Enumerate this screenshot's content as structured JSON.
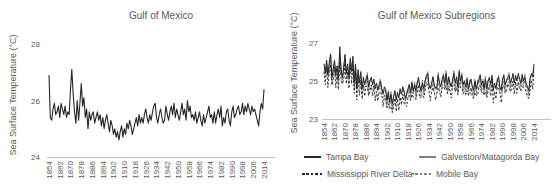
{
  "colors": {
    "line_black": "#262626",
    "line_gray": "#808080",
    "axis_line": "#bfbfbf",
    "text": "#595959"
  },
  "chart_data": [
    {
      "id": "gulf",
      "type": "line",
      "title": "Gulf of Mexico",
      "ylabel": "Sea Surface Temperature (°C)",
      "x_start": 1854,
      "x_end": 2014,
      "x_step": 1,
      "x_ticks": [
        1854,
        1862,
        1870,
        1878,
        1886,
        1894,
        1902,
        1910,
        1918,
        1926,
        1934,
        1942,
        1950,
        1958,
        1966,
        1974,
        1982,
        1990,
        1998,
        2006,
        2014
      ],
      "y_ticks": [
        24,
        26,
        28
      ],
      "ylim": [
        24,
        28.3
      ],
      "grid": false,
      "legend_position": "none",
      "series": [
        {
          "name": "Gulf of Mexico",
          "color": "#262626",
          "dash": null,
          "width": 1.1,
          "values": [
            26.9,
            25.4,
            25.3,
            25.7,
            25.9,
            25.5,
            25.6,
            25.8,
            25.4,
            25.9,
            25.7,
            25.5,
            25.8,
            25.4,
            25.6,
            25.5,
            26.4,
            27.1,
            26.2,
            25.6,
            25.2,
            26.0,
            25.3,
            25.9,
            26.6,
            25.8,
            26.1,
            25.4,
            25.7,
            25.0,
            25.6,
            25.3,
            25.5,
            25.6,
            25.2,
            25.4,
            25.6,
            25.3,
            25.5,
            25.1,
            25.4,
            25.0,
            25.3,
            25.5,
            25.2,
            24.9,
            25.3,
            25.1,
            24.8,
            25.0,
            24.7,
            24.9,
            24.6,
            24.9,
            25.1,
            24.7,
            25.0,
            24.8,
            25.2,
            25.0,
            25.3,
            25.1,
            24.8,
            25.0,
            25.2,
            25.4,
            25.1,
            25.5,
            25.2,
            25.4,
            25.2,
            25.5,
            25.7,
            25.4,
            25.2,
            25.5,
            25.3,
            25.6,
            25.8,
            25.9,
            25.4,
            25.2,
            25.5,
            25.7,
            25.4,
            25.2,
            25.3,
            25.8,
            25.5,
            25.3,
            25.6,
            25.8,
            25.5,
            25.9,
            25.4,
            25.7,
            25.5,
            25.3,
            25.6,
            25.9,
            25.5,
            25.7,
            25.3,
            26.0,
            25.6,
            25.8,
            25.4,
            25.5,
            25.3,
            25.6,
            25.2,
            25.4,
            25.6,
            25.3,
            25.1,
            25.5,
            25.2,
            25.4,
            25.6,
            25.8,
            25.4,
            25.5,
            25.2,
            25.6,
            25.2,
            25.5,
            25.7,
            25.4,
            25.8,
            25.1,
            25.4,
            25.2,
            25.6,
            25.7,
            25.3,
            25.1,
            25.6,
            25.8,
            25.4,
            25.5,
            25.7,
            25.8,
            25.5,
            25.6,
            25.9,
            25.5,
            25.8,
            25.6,
            25.9,
            25.7,
            25.5,
            25.8,
            25.6,
            25.7,
            25.5,
            25.3,
            25.1,
            25.6,
            25.9,
            25.7,
            26.4
          ]
        }
      ]
    },
    {
      "id": "subregions",
      "type": "line",
      "title": "Gulf of Mexico Subregions",
      "ylabel": "Sea Surface Temperature (°C)",
      "x_start": 1854,
      "x_end": 2014,
      "x_step": 1,
      "x_ticks": [
        1854,
        1862,
        1870,
        1878,
        1886,
        1894,
        1902,
        1910,
        1918,
        1926,
        1934,
        1942,
        1950,
        1958,
        1966,
        1974,
        1982,
        1990,
        1998,
        2006,
        2014
      ],
      "y_ticks": [
        23,
        25,
        27
      ],
      "ylim": [
        23,
        27.2
      ],
      "grid": false,
      "legend_position": "bottom",
      "series": [
        {
          "name": "Galveston/Matagorda Bay",
          "color": "#808080",
          "dash": null,
          "width": 0.9,
          "values": [
            25.7,
            25.5,
            25.95,
            25.45,
            25.75,
            26.45,
            25.0,
            25.7,
            25.95,
            25.45,
            25.55,
            25.15,
            26.3,
            25.7,
            25.05,
            25.85,
            26.15,
            25.45,
            25.7,
            25.3,
            26.05,
            25.65,
            26.05,
            24.95,
            25.7,
            24.7,
            25.45,
            25.05,
            25.25,
            24.65,
            25.0,
            24.9,
            24.95,
            25.45,
            24.45,
            25.05,
            25.0,
            24.9,
            24.95,
            24.75,
            24.65,
            24.55,
            24.6,
            25.1,
            24.45,
            24.45,
            24.45,
            24.55,
            23.8,
            24.5,
            23.75,
            24.45,
            23.55,
            24.25,
            24.3,
            24.1,
            24.25,
            24.25,
            24.35,
            24.35,
            24.5,
            24.5,
            23.95,
            24.45,
            24.35,
            24.85,
            24.2,
            25.0,
            24.35,
            24.95,
            24.25,
            24.95,
            25.0,
            24.8,
            24.35,
            25.05,
            24.35,
            25.05,
            25.1,
            25.5,
            24.65,
            24.75,
            24.65,
            25.25,
            24.6,
            24.7,
            24.55,
            25.45,
            24.65,
            24.75,
            24.9,
            25.4,
            24.75,
            25.55,
            24.55,
            25.25,
            24.7,
            24.8,
            24.95,
            25.55,
            24.65,
            25.25,
            24.5,
            25.6,
            24.85,
            25.45,
            24.55,
            25.05,
            24.5,
            25.2,
            24.45,
            25.05,
            24.85,
            24.75,
            24.3,
            25.1,
            24.45,
            25.05,
            24.85,
            25.35,
            24.6,
            25.1,
            24.45,
            25.25,
            24.35,
            25.05,
            25.0,
            24.9,
            25.15,
            24.65,
            24.65,
            24.65,
            24.9,
            25.3,
            24.55,
            24.65,
            24.85,
            25.35,
            24.6,
            25.1,
            25.05,
            25.45,
            24.65,
            25.15,
            25.2,
            25.0,
            25.15,
            25.15,
            25.15,
            25.15,
            24.7,
            25.4,
            24.85,
            25.35,
            24.65,
            24.75,
            24.3,
            25.2,
            25.25,
            25.35,
            25.65
          ]
        },
        {
          "name": "Mobile Bay",
          "color": "#808080",
          "dash": "2.4,1.8",
          "width": 0.9,
          "values": [
            25.45,
            25.2,
            25.75,
            25.15,
            25.5,
            26.1,
            24.75,
            25.4,
            25.75,
            25.15,
            25.3,
            24.8,
            26.35,
            25.4,
            24.85,
            25.55,
            25.9,
            25.1,
            25.45,
            25.0,
            25.85,
            25.35,
            25.8,
            24.6,
            25.45,
            24.4,
            25.25,
            24.75,
            25.0,
            24.3,
            24.75,
            24.6,
            24.75,
            25.15,
            24.2,
            24.7,
            24.75,
            24.6,
            24.75,
            24.45,
            24.4,
            24.2,
            24.35,
            24.8,
            24.25,
            24.15,
            24.2,
            24.2,
            23.55,
            24.2,
            23.55,
            24.15,
            23.3,
            23.9,
            24.05,
            23.8,
            24.05,
            23.95,
            24.1,
            24.0,
            24.25,
            24.2,
            23.75,
            24.15,
            24.1,
            24.5,
            23.95,
            24.7,
            24.15,
            24.65,
            24.0,
            24.6,
            24.75,
            24.5,
            24.15,
            24.75,
            24.1,
            24.7,
            24.85,
            25.2,
            24.45,
            24.45,
            24.4,
            24.9,
            24.35,
            24.4,
            24.35,
            25.15,
            24.4,
            24.4,
            24.65,
            25.1,
            24.55,
            25.25,
            24.3,
            24.9,
            24.45,
            24.5,
            24.75,
            25.25,
            24.4,
            24.9,
            24.25,
            25.3,
            24.65,
            25.15,
            24.3,
            24.7,
            24.25,
            24.9,
            24.25,
            24.75,
            24.6,
            24.4,
            24.05,
            24.8,
            24.25,
            24.75,
            24.6,
            25.0,
            24.35,
            24.8,
            24.25,
            24.95,
            24.1,
            24.7,
            24.75,
            24.6,
            24.95,
            24.35,
            24.4,
            24.3,
            24.65,
            25.0,
            24.35,
            24.35,
            24.6,
            25.0,
            24.35,
            24.8,
            24.85,
            25.15,
            24.4,
            24.9,
            24.95,
            24.7,
            24.95,
            24.85,
            24.9,
            24.9,
            24.45,
            25.1,
            24.65,
            25.05,
            24.4,
            24.5,
            24.05,
            24.9,
            25.05,
            25.05,
            25.6
          ]
        },
        {
          "name": "Mississippi River Delta",
          "color": "#262626",
          "dash": "2.4,1.8",
          "width": 0.9,
          "values": [
            25.5,
            24.8,
            25.75,
            24.65,
            25.55,
            25.85,
            24.8,
            25.0,
            25.75,
            24.65,
            25.35,
            24.55,
            26.0,
            25.0,
            24.85,
            25.05,
            25.95,
            24.85,
            25.5,
            24.6,
            25.85,
            24.85,
            25.85,
            24.35,
            25.5,
            24.0,
            25.25,
            24.25,
            25.05,
            24.05,
            24.8,
            24.2,
            24.75,
            24.65,
            24.25,
            24.45,
            24.8,
            24.2,
            24.75,
            23.95,
            24.45,
            23.95,
            24.4,
            24.4,
            24.25,
            23.65,
            24.25,
            23.95,
            23.6,
            23.8,
            23.55,
            23.65,
            23.35,
            23.65,
            24.1,
            23.4,
            24.05,
            23.45,
            24.15,
            23.75,
            24.3,
            23.8,
            23.75,
            23.65,
            24.15,
            24.25,
            24.0,
            24.3,
            24.15,
            24.15,
            24.05,
            24.35,
            24.8,
            24.1,
            24.15,
            24.25,
            24.15,
            24.45,
            24.9,
            24.8,
            24.45,
            23.95,
            24.45,
            24.65,
            24.4,
            24.0,
            24.35,
            24.65,
            24.45,
            24.15,
            24.7,
            24.7,
            24.55,
            24.75,
            24.35,
            24.65,
            24.5,
            24.1,
            24.75,
            24.75,
            24.45,
            24.65,
            24.3,
            24.9,
            24.65,
            24.65,
            24.35,
            24.45,
            24.3,
            24.5,
            24.25,
            24.25,
            24.65,
            24.15,
            24.1,
            24.4,
            24.25,
            24.25,
            24.65,
            24.75,
            24.4,
            24.4,
            24.25,
            24.45,
            24.15,
            24.45,
            24.8,
            24.2,
            24.95,
            23.85,
            24.45,
            24.05,
            24.7,
            24.6,
            24.35,
            23.85,
            24.65,
            24.75,
            24.4,
            24.4,
            24.85,
            24.65,
            24.45,
            24.55,
            25.0,
            24.3,
            24.95,
            24.35,
            24.95,
            24.55,
            24.5,
            24.7,
            24.65,
            24.55,
            24.45,
            24.15,
            24.1,
            24.5,
            25.05,
            24.55,
            25.45
          ]
        },
        {
          "name": "Tampa Bay",
          "color": "#262626",
          "dash": null,
          "width": 1.0,
          "values": [
            25.9,
            25.4,
            26.1,
            25.3,
            26.0,
            26.4,
            25.2,
            25.6,
            26.1,
            25.3,
            25.8,
            25.1,
            26.8,
            25.6,
            25.2,
            25.7,
            26.4,
            25.4,
            25.9,
            25.2,
            26.2,
            25.5,
            26.3,
            24.9,
            25.9,
            24.6,
            25.6,
            24.9,
            25.5,
            24.6,
            25.2,
            24.8,
            25.1,
            25.3,
            24.7,
            25.0,
            25.2,
            24.8,
            25.1,
            24.6,
            24.9,
            24.5,
            24.8,
            25.0,
            24.6,
            24.3,
            24.7,
            24.5,
            24.0,
            24.4,
            23.9,
            24.3,
            23.8,
            24.2,
            24.5,
            24.0,
            24.4,
            24.1,
            24.6,
            24.3,
            24.7,
            24.4,
            24.1,
            24.3,
            24.6,
            24.8,
            24.4,
            24.9,
            24.5,
            24.8,
            24.5,
            24.9,
            25.2,
            24.7,
            24.5,
            24.9,
            24.6,
            25.0,
            25.3,
            25.4,
            24.8,
            24.6,
            24.9,
            25.2,
            24.8,
            24.6,
            24.7,
            25.3,
            24.9,
            24.7,
            25.1,
            25.3,
            24.9,
            25.4,
            24.8,
            25.2,
            24.9,
            24.7,
            25.1,
            25.4,
            24.9,
            25.2,
            24.7,
            25.5,
            25.0,
            25.3,
            24.8,
            25.0,
            24.7,
            25.1,
            24.6,
            24.9,
            25.1,
            24.7,
            24.5,
            25.0,
            24.6,
            24.9,
            25.1,
            25.3,
            24.8,
            25.0,
            24.6,
            25.1,
            24.6,
            25.0,
            25.2,
            24.8,
            25.3,
            24.5,
            24.9,
            24.6,
            25.1,
            25.2,
            24.7,
            24.5,
            25.1,
            25.3,
            24.8,
            25.0,
            25.2,
            25.3,
            24.9,
            25.1,
            25.4,
            24.9,
            25.3,
            25.0,
            25.4,
            25.1,
            24.9,
            25.3,
            25.0,
            25.2,
            24.9,
            24.7,
            24.5,
            25.1,
            25.4,
            25.2,
            25.9
          ]
        }
      ]
    }
  ]
}
